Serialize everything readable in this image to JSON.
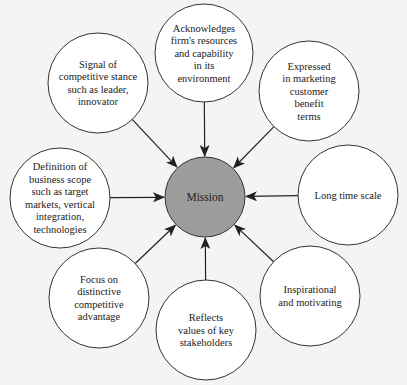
{
  "diagram": {
    "colors": {
      "background": "#f4f4f2",
      "circle_stroke": "#333333",
      "circle_fill": "#ffffff",
      "center_fill": "#9c9c9c",
      "arrow": "#222222"
    },
    "center": {
      "label": "Mission",
      "cx": 205,
      "cy": 197,
      "r": 40
    },
    "nodes": [
      {
        "id": "top",
        "cx": 204,
        "cy": 53,
        "r": 49,
        "lines": [
          "Acknowledges",
          "firm's resources",
          "and capability",
          "in its",
          "environment"
        ]
      },
      {
        "id": "top-left",
        "cx": 98,
        "cy": 83,
        "r": 50,
        "lines": [
          "Signal of",
          "competitive stance",
          "such as leader,",
          "innovator"
        ]
      },
      {
        "id": "top-right",
        "cx": 309,
        "cy": 91,
        "r": 50,
        "lines": [
          "Expressed",
          "in marketing",
          "customer",
          "benefit",
          "terms"
        ]
      },
      {
        "id": "left",
        "cx": 60,
        "cy": 198,
        "r": 50,
        "lines": [
          "Definition of",
          "business scope",
          "such as target",
          "markets, vertical",
          "integration,",
          "technologies"
        ]
      },
      {
        "id": "right",
        "cx": 348,
        "cy": 195,
        "r": 50,
        "lines": [
          "Long time scale"
        ]
      },
      {
        "id": "bottom-left",
        "cx": 99,
        "cy": 298,
        "r": 50,
        "lines": [
          "Focus on",
          "distinctive",
          "competitive",
          "advantage"
        ]
      },
      {
        "id": "bottom",
        "cx": 206,
        "cy": 330,
        "r": 50,
        "lines": [
          "Reflects",
          "values of key",
          "stakeholders"
        ]
      },
      {
        "id": "bottom-right",
        "cx": 310,
        "cy": 296,
        "r": 50,
        "lines": [
          "Inspirational",
          "and motivating"
        ]
      }
    ]
  }
}
